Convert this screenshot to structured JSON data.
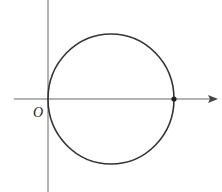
{
  "diagram": {
    "type": "coordinate-plane-circle",
    "origin_label": "O",
    "axes": {
      "x_axis": {
        "y": 99,
        "x_start": 14,
        "x_end": 218,
        "arrow": true
      },
      "y_axis": {
        "x": 48,
        "y_start": 0,
        "y_end": 192,
        "arrow": false
      }
    },
    "circle": {
      "cx": 111,
      "cy": 99,
      "rx": 63,
      "ry": 65,
      "passes_through_origin": true
    },
    "points": [
      {
        "name": "x-intercept-dot",
        "x": 174,
        "y": 99
      }
    ],
    "colors": {
      "stroke": "#333333",
      "axis": "#555555",
      "background": "#ffffff"
    }
  }
}
